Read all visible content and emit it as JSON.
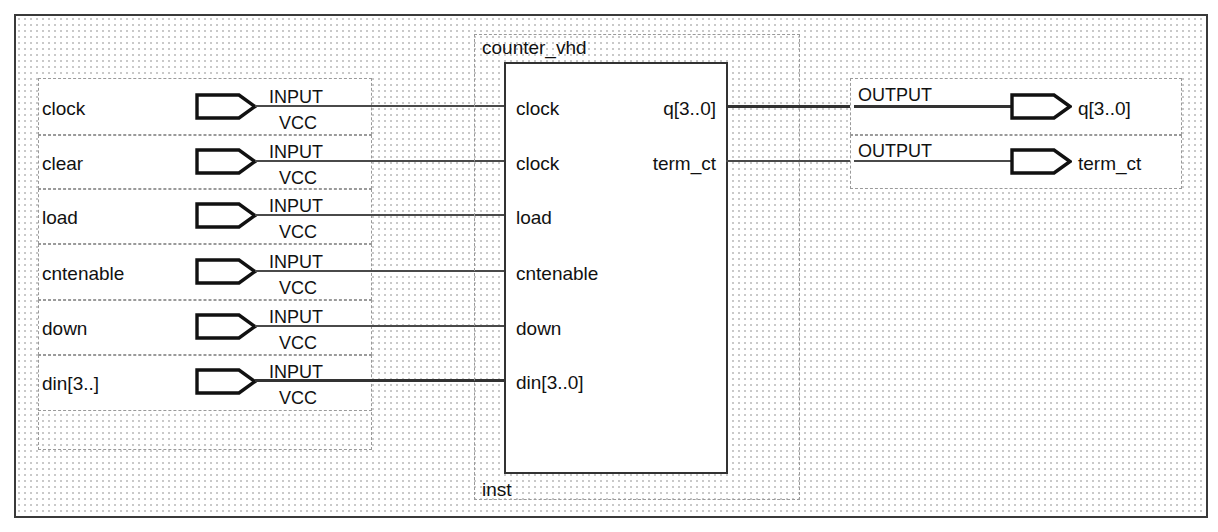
{
  "diagram": {
    "title": "counter_vhd",
    "instance_name": "inst",
    "pin_symbol_input_label": "INPUT",
    "pin_symbol_input_sublabel": "VCC",
    "pin_symbol_output_label": "OUTPUT",
    "colors": {
      "frame": "#3a3a3a",
      "wire": "#4a4a4a",
      "bus": "#333333",
      "dotted": "#9a9a9a",
      "grid_dot": "#c9c9c9",
      "text": "#111111",
      "block_border": "#333333"
    }
  },
  "inputs": [
    {
      "name": "clock",
      "type": "INPUT",
      "default": "VCC",
      "bus": false
    },
    {
      "name": "clear",
      "type": "INPUT",
      "default": "VCC",
      "bus": false
    },
    {
      "name": "load",
      "type": "INPUT",
      "default": "VCC",
      "bus": false
    },
    {
      "name": "cntenable",
      "type": "INPUT",
      "default": "VCC",
      "bus": false
    },
    {
      "name": "down",
      "type": "INPUT",
      "default": "VCC",
      "bus": false
    },
    {
      "name": "din[3..]",
      "type": "INPUT",
      "default": "VCC",
      "bus": true
    }
  ],
  "outputs": [
    {
      "name": "q[3..0]",
      "type": "OUTPUT",
      "bus": true
    },
    {
      "name": "term_ct",
      "type": "OUTPUT",
      "bus": false
    }
  ],
  "block": {
    "name": "counter_vhd",
    "instance": "inst",
    "input_pins": [
      {
        "label": "clock"
      },
      {
        "label": "clock"
      },
      {
        "label": "load"
      },
      {
        "label": "cntenable"
      },
      {
        "label": "down"
      },
      {
        "label": "din[3..0]"
      }
    ],
    "output_pins": [
      {
        "label": "q[3..0]"
      },
      {
        "label": "term_ct"
      }
    ]
  }
}
